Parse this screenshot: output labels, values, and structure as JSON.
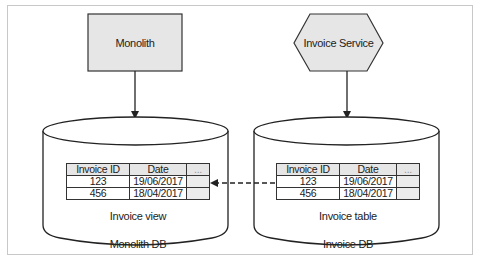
{
  "diagram": {
    "nodes": {
      "monolith": {
        "label": "Monolith",
        "shape": "rectangle",
        "fill": "#e6e6e6"
      },
      "invoice_service": {
        "label": "Invoice Service",
        "shape": "hexagon",
        "fill": "#e6e6e6"
      },
      "monolith_db": {
        "label": "Monolith DB",
        "shape": "cylinder"
      },
      "invoice_db": {
        "label": "Invoice DB",
        "shape": "cylinder"
      }
    },
    "tables": {
      "invoice_view": {
        "caption": "Invoice view",
        "headers": [
          "Invoice ID",
          "Date",
          "..."
        ],
        "rows": [
          [
            "123",
            "19/06/2017",
            ""
          ],
          [
            "456",
            "18/04/2017",
            ""
          ]
        ]
      },
      "invoice_table": {
        "caption": "Invoice table",
        "headers": [
          "Invoice ID",
          "Date",
          "..."
        ],
        "rows": [
          [
            "123",
            "19/06/2017",
            ""
          ],
          [
            "456",
            "18/04/2017",
            ""
          ]
        ]
      }
    },
    "edges": [
      {
        "from": "monolith",
        "to": "monolith_db",
        "style": "solid"
      },
      {
        "from": "invoice_service",
        "to": "invoice_db",
        "style": "solid"
      },
      {
        "from": "invoice_table",
        "to": "invoice_view",
        "style": "dashed"
      }
    ],
    "colors": {
      "stroke": "#222222",
      "node_fill": "#e6e6e6",
      "frame": "#c8c8c8"
    }
  }
}
